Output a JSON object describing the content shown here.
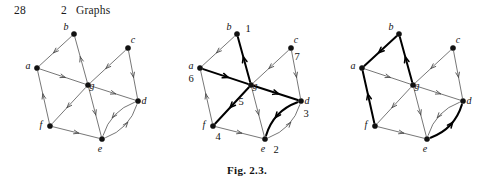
{
  "running_head": {
    "folio": "28",
    "chapter_number": "2",
    "chapter_title": "Graphs"
  },
  "figure": {
    "caption": "Fig. 2.3.",
    "panel_count": 3
  },
  "colors": {
    "ink": "#111111",
    "edge_thin": "#4a4a4a",
    "edge_bold": "#000000",
    "page": "#ffffff"
  },
  "graph": {
    "vertices": [
      {
        "id": "a",
        "label": "a",
        "x": 32,
        "y": 50,
        "label_dx": -9,
        "label_dy": 1
      },
      {
        "id": "b",
        "label": "b",
        "x": 69,
        "y": 16,
        "label_dx": -8,
        "label_dy": -4
      },
      {
        "id": "c",
        "label": "c",
        "x": 123,
        "y": 30,
        "label_dx": 5,
        "label_dy": -5
      },
      {
        "id": "d",
        "label": "d",
        "x": 133,
        "y": 83,
        "label_dx": 6,
        "label_dy": 3
      },
      {
        "id": "e",
        "label": "e",
        "x": 97,
        "y": 121,
        "label_dx": -2,
        "label_dy": 13
      },
      {
        "id": "f",
        "label": "f",
        "x": 45,
        "y": 108,
        "label_dx": -9,
        "label_dy": 2
      },
      {
        "id": "g",
        "label": "g",
        "x": 83,
        "y": 67,
        "label_dx": 4,
        "label_dy": 4
      }
    ],
    "edges": [
      {
        "from": "b",
        "to": "a",
        "kind": "straight"
      },
      {
        "from": "g",
        "to": "b",
        "kind": "straight"
      },
      {
        "from": "a",
        "to": "g",
        "kind": "straight"
      },
      {
        "from": "c",
        "to": "g",
        "kind": "straight"
      },
      {
        "from": "c",
        "to": "d",
        "kind": "straight"
      },
      {
        "from": "g",
        "to": "d",
        "kind": "straight"
      },
      {
        "from": "g",
        "to": "e",
        "kind": "straight"
      },
      {
        "from": "g",
        "to": "f",
        "kind": "straight"
      },
      {
        "from": "f",
        "to": "a",
        "kind": "straight"
      },
      {
        "from": "f",
        "to": "e",
        "kind": "straight"
      },
      {
        "from": "e",
        "to": "d",
        "kind": "curve",
        "bow": 13
      },
      {
        "from": "d",
        "to": "e",
        "kind": "curve",
        "bow": 13
      }
    ]
  },
  "panels": [
    {
      "name": "panel-plain-digraph",
      "numbers": {},
      "bold_edges": []
    },
    {
      "name": "panel-numbered-digraph",
      "numbers": {
        "b": "1",
        "e": "2",
        "d": "3",
        "f": "4",
        "g": "5",
        "a": "6",
        "c": "7"
      },
      "number_offsets": {
        "a": {
          "dx": -9,
          "dy": 14
        },
        "b": {
          "dx": 11,
          "dy": -2
        },
        "c": {
          "dx": 6,
          "dy": 12
        },
        "d": {
          "dx": 5,
          "dy": 16
        },
        "e": {
          "dx": 11,
          "dy": 14
        },
        "f": {
          "dx": 5,
          "dy": 14
        },
        "g": {
          "dx": -10,
          "dy": 20
        }
      },
      "bold_edges": [
        "g-b",
        "a-g",
        "g-f",
        "g-d",
        "d-e"
      ]
    },
    {
      "name": "panel-spanning-tree-digraph",
      "numbers": {},
      "bold_edges": [
        "b-a",
        "g-b",
        "f-a",
        "e-d"
      ]
    }
  ]
}
